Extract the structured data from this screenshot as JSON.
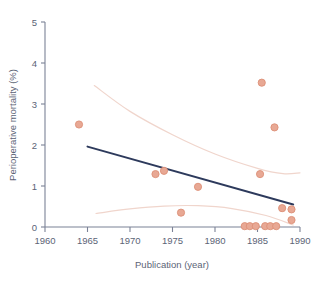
{
  "chart_data": {
    "type": "scatter",
    "title": "",
    "xlabel": "Publication (year)",
    "ylabel": "Perioperative mortality (%)",
    "xlim": [
      1960,
      1990
    ],
    "ylim": [
      0,
      5
    ],
    "xticks": [
      1960,
      1965,
      1970,
      1975,
      1980,
      1985,
      1990
    ],
    "xtick_labels": [
      "1960",
      "1965",
      "1970",
      "1975",
      "1980",
      "1985",
      "1990"
    ],
    "yticks": [
      0,
      1,
      2,
      3,
      4,
      5
    ],
    "ytick_labels": [
      "0",
      "1",
      "2",
      "3",
      "4",
      "5"
    ],
    "grid": false,
    "legend": null,
    "points": [
      {
        "x": 1964.0,
        "y": 2.5
      },
      {
        "x": 1973.0,
        "y": 1.29
      },
      {
        "x": 1974.0,
        "y": 1.37
      },
      {
        "x": 1976.0,
        "y": 0.35
      },
      {
        "x": 1978.0,
        "y": 0.98
      },
      {
        "x": 1983.5,
        "y": 0.02
      },
      {
        "x": 1984.1,
        "y": 0.02
      },
      {
        "x": 1984.8,
        "y": 0.02
      },
      {
        "x": 1985.3,
        "y": 1.29
      },
      {
        "x": 1985.5,
        "y": 3.52
      },
      {
        "x": 1985.9,
        "y": 0.02
      },
      {
        "x": 1986.5,
        "y": 0.02
      },
      {
        "x": 1987.0,
        "y": 2.43
      },
      {
        "x": 1987.2,
        "y": 0.02
      },
      {
        "x": 1987.9,
        "y": 0.46
      },
      {
        "x": 1989.0,
        "y": 0.43
      },
      {
        "x": 1989.0,
        "y": 0.17
      }
    ],
    "regression_line": {
      "x_start": 1965.0,
      "y_start": 1.96,
      "x_end": 1989.2,
      "y_end": 0.55
    },
    "upper_confidence_band": [
      {
        "x": 1965.8,
        "y": 3.45
      },
      {
        "x": 1970.0,
        "y": 2.82
      },
      {
        "x": 1975.0,
        "y": 2.25
      },
      {
        "x": 1980.0,
        "y": 1.78
      },
      {
        "x": 1985.0,
        "y": 1.43
      },
      {
        "x": 1988.0,
        "y": 1.3
      },
      {
        "x": 1990.0,
        "y": 1.32
      }
    ],
    "lower_confidence_band": [
      {
        "x": 1966.0,
        "y": 0.33
      },
      {
        "x": 1970.0,
        "y": 0.44
      },
      {
        "x": 1974.0,
        "y": 0.51
      },
      {
        "x": 1978.0,
        "y": 0.52
      },
      {
        "x": 1982.0,
        "y": 0.45
      },
      {
        "x": 1986.0,
        "y": 0.28
      },
      {
        "x": 1989.2,
        "y": 0.05
      }
    ],
    "colors": {
      "point_fill": "#e8a894",
      "point_stroke": "#dd9077",
      "regression_line": "#2d3a5c",
      "confidence_band": "#f0d5cc",
      "axis": "#7b8296",
      "text": "#5c6476"
    }
  }
}
